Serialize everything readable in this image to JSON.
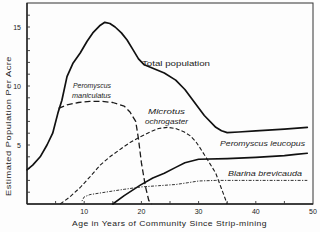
{
  "chart_data": {
    "type": "line",
    "title": "",
    "xlabel": "Age in Years of Community Since Strip-mining",
    "ylabel": "Estimated Population Per Acre",
    "xlim": [
      0,
      50
    ],
    "ylim": [
      0,
      17
    ],
    "grid": false,
    "legend": "none (series labelled directly on the plot)",
    "xticks": [
      10,
      20,
      30,
      40,
      50
    ],
    "yticks": [
      5,
      10,
      15
    ],
    "series": [
      {
        "name": "Total population",
        "style": "solid-thick",
        "points": [
          [
            0,
            2.9
          ],
          [
            1,
            3.3
          ],
          [
            2.3,
            4.0
          ],
          [
            3.5,
            5.0
          ],
          [
            4.5,
            6.0
          ],
          [
            5.4,
            7.7
          ],
          [
            6.1,
            8.8
          ],
          [
            7,
            10.8
          ],
          [
            8,
            11.9
          ],
          [
            9.3,
            12.8
          ],
          [
            10.5,
            13.8
          ],
          [
            11.5,
            14.5
          ],
          [
            12.7,
            15.1
          ],
          [
            13.6,
            15.4
          ],
          [
            14.5,
            15.3
          ],
          [
            15.4,
            15.0
          ],
          [
            16.5,
            14.5
          ],
          [
            17.5,
            13.9
          ],
          [
            18.5,
            13.1
          ],
          [
            19.5,
            12.3
          ],
          [
            20.5,
            11.8
          ],
          [
            22,
            11.5
          ],
          [
            24,
            11.1
          ],
          [
            26,
            10.5
          ],
          [
            27.6,
            9.7
          ],
          [
            29,
            8.8
          ],
          [
            31,
            7.5
          ],
          [
            33,
            6.5
          ],
          [
            34,
            6.2
          ],
          [
            35,
            6.05
          ],
          [
            37,
            6.1
          ],
          [
            40,
            6.2
          ],
          [
            45,
            6.35
          ],
          [
            49,
            6.5
          ]
        ]
      },
      {
        "name": "Peromyscus maniculatus",
        "style": "long-dash",
        "points": [
          [
            5.5,
            8.1
          ],
          [
            7,
            8.4
          ],
          [
            9,
            8.6
          ],
          [
            11,
            8.7
          ],
          [
            13,
            8.7
          ],
          [
            15,
            8.6
          ],
          [
            17,
            8.3
          ],
          [
            18,
            7.8
          ],
          [
            19,
            7.0
          ],
          [
            19.5,
            5.5
          ],
          [
            20,
            3.5
          ],
          [
            20.7,
            1.5
          ],
          [
            21.3,
            0.3
          ],
          [
            21.8,
            0
          ]
        ]
      },
      {
        "name": "Microtus ochrogaster",
        "style": "dash",
        "points": [
          [
            5.8,
            0
          ],
          [
            7.5,
            0.6
          ],
          [
            9.3,
            1.4
          ],
          [
            11,
            2.3
          ],
          [
            12.8,
            3.3
          ],
          [
            14.5,
            4.0
          ],
          [
            16.5,
            4.7
          ],
          [
            18,
            5.2
          ],
          [
            19.8,
            5.7
          ],
          [
            21.5,
            6.1
          ],
          [
            23,
            6.4
          ],
          [
            24.6,
            6.5
          ],
          [
            26,
            6.4
          ],
          [
            27.5,
            6.1
          ],
          [
            28.5,
            5.8
          ],
          [
            29.5,
            5.3
          ],
          [
            30.2,
            4.8
          ],
          [
            31.5,
            3.8
          ],
          [
            33,
            2.6
          ],
          [
            34,
            1.3
          ],
          [
            35,
            0
          ]
        ]
      },
      {
        "name": "Peromyscus leucopus",
        "style": "solid",
        "points": [
          [
            15,
            0
          ],
          [
            17,
            0.7
          ],
          [
            19.8,
            1.6
          ],
          [
            22,
            2.2
          ],
          [
            24,
            2.6
          ],
          [
            26,
            3.1
          ],
          [
            27.6,
            3.5
          ],
          [
            30,
            3.8
          ],
          [
            35,
            3.85
          ],
          [
            40,
            3.95
          ],
          [
            45,
            4.1
          ],
          [
            47,
            4.2
          ],
          [
            49,
            4.3
          ]
        ]
      },
      {
        "name": "Blarina brevicauda",
        "style": "dot-dash",
        "points": [
          [
            9.6,
            0.25
          ],
          [
            10,
            0.6
          ],
          [
            11,
            0.8
          ],
          [
            13,
            0.95
          ],
          [
            15,
            1.1
          ],
          [
            17,
            1.25
          ],
          [
            20,
            1.45
          ],
          [
            23,
            1.55
          ],
          [
            26,
            1.65
          ],
          [
            28,
            1.8
          ],
          [
            30,
            1.95
          ],
          [
            33,
            2.0
          ],
          [
            40,
            2.0
          ],
          [
            49,
            2.0
          ]
        ]
      }
    ],
    "annotations": {
      "total": "Total population",
      "maniculatus_1": "Peromyscus",
      "maniculatus_2": "maniculatus",
      "microtus_1": "Microtus",
      "microtus_2": "ochrogaster",
      "leucopus": "Peromyscus  leucopus",
      "blarina": "Blarina  brevicauda"
    }
  }
}
